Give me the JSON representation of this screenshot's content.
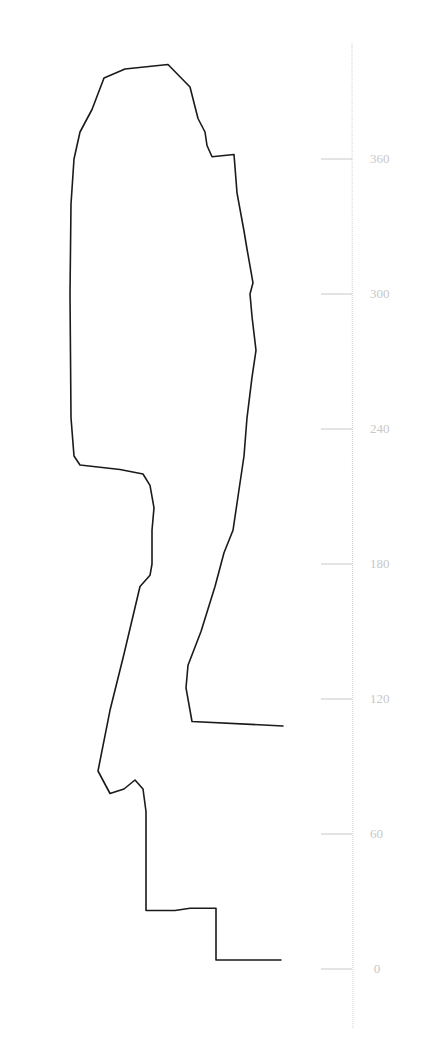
{
  "chart_data": {
    "type": "line",
    "title": "",
    "xlabel": "",
    "ylabel": "",
    "orientation": "vertical-profile",
    "axis": {
      "position": "right",
      "ylim": [
        -25,
        410
      ],
      "ticks": [
        0,
        60,
        120,
        180,
        240,
        300,
        360
      ],
      "tick_labels": [
        "0",
        "60",
        "120",
        "180",
        "240",
        "300",
        "360"
      ],
      "grid": false,
      "color": "#c8c8c8"
    },
    "line_color": "#1a1a1a",
    "series": [
      {
        "name": "profile",
        "points_px_x_vs_value": [
          [
            281,
            4
          ],
          [
            216,
            4
          ],
          [
            216,
            27
          ],
          [
            190,
            27
          ],
          [
            175,
            26
          ],
          [
            146,
            26
          ],
          [
            146,
            70
          ],
          [
            143,
            80
          ],
          [
            135,
            84
          ],
          [
            124,
            80
          ],
          [
            110,
            78
          ],
          [
            98,
            88
          ],
          [
            110,
            115
          ],
          [
            124,
            140
          ],
          [
            140,
            170
          ],
          [
            150,
            175
          ],
          [
            152,
            180
          ],
          [
            152,
            190
          ],
          [
            152,
            195
          ],
          [
            154,
            205
          ],
          [
            150,
            215
          ],
          [
            143,
            220
          ],
          [
            120,
            222
          ],
          [
            80,
            224
          ],
          [
            74,
            228
          ],
          [
            71,
            245
          ],
          [
            70,
            300
          ],
          [
            71,
            340
          ],
          [
            74,
            360
          ],
          [
            80,
            372
          ],
          [
            92,
            382
          ],
          [
            104,
            396
          ],
          [
            125,
            400
          ],
          [
            168,
            402
          ],
          [
            190,
            392
          ],
          [
            198,
            378
          ],
          [
            205,
            372
          ],
          [
            207,
            366
          ],
          [
            212,
            361
          ],
          [
            234,
            362
          ],
          [
            237,
            345
          ],
          [
            244,
            328
          ],
          [
            247,
            320
          ],
          [
            253,
            305
          ],
          [
            250,
            300
          ],
          [
            252,
            290
          ],
          [
            256,
            275
          ],
          [
            252,
            263
          ],
          [
            247,
            245
          ],
          [
            244,
            228
          ],
          [
            238,
            210
          ],
          [
            233,
            195
          ],
          [
            224,
            185
          ],
          [
            215,
            170
          ],
          [
            201,
            150
          ],
          [
            188,
            135
          ],
          [
            186,
            125
          ],
          [
            192,
            110
          ],
          [
            283,
            108
          ]
        ]
      }
    ]
  }
}
